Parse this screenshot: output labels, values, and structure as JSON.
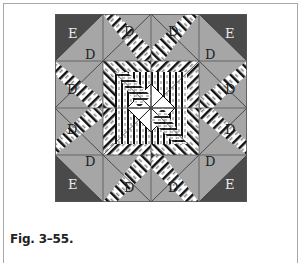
{
  "figure": {
    "caption": "Fig. 3–55.",
    "labels": {
      "corner": "E",
      "side": "D"
    },
    "colors": {
      "dark": "#4a4a4a",
      "medium": "#a6a6a6",
      "light": "#ffffff",
      "black": "#111111",
      "stroke": "#555555",
      "label_on_dark": "#e8e8e8",
      "label_on_medium": "#222222"
    },
    "layout": {
      "grid": "4x4 blocks",
      "corner_blocks": [
        "top-left",
        "top-right",
        "bottom-left",
        "bottom-right"
      ],
      "corner_block_pieces": [
        "E",
        "D"
      ],
      "edge_block_pieces": [
        "D",
        "D"
      ]
    }
  }
}
